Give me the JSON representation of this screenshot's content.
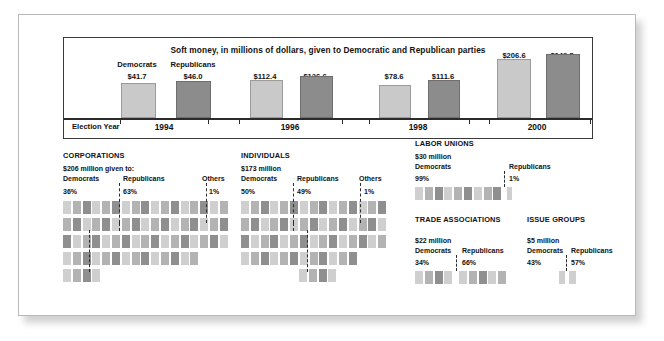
{
  "top": {
    "title": "Soft money, in millions of dollars, given to Democratic and Republican parties",
    "election_year_label": "Election Year",
    "legend": {
      "democrats": "Democrats",
      "republicans": "Republicans"
    },
    "years": [
      "1994",
      "1996",
      "1998",
      "2000"
    ],
    "values": {
      "1994": {
        "dem": "$41.7",
        "rep": "$46.0"
      },
      "1996": {
        "dem": "$112.4",
        "rep": "$126.6"
      },
      "1998": {
        "dem": "$78.6",
        "rep": "$111.6"
      },
      "2000": {
        "dem": "$206.6",
        "rep": "$242.5"
      }
    }
  },
  "sections": {
    "corporations": {
      "title": "CORPORATIONS",
      "amount": "$206 million given to:",
      "dem_label": "Democrats",
      "rep_label": "Republicans",
      "oth_label": "Others",
      "dem_pct": "36%",
      "rep_pct": "63%",
      "oth_pct": "1%"
    },
    "individuals": {
      "title": "INDIVIDUALS",
      "amount": "$173 million",
      "dem_label": "Democrats",
      "rep_label": "Republicans",
      "oth_label": "Others",
      "dem_pct": "50%",
      "rep_pct": "49%",
      "oth_pct": "1%"
    },
    "labor_unions": {
      "title": "LABOR UNIONS",
      "amount": "$30 million",
      "dem_label": "Democrats",
      "rep_label": "Republicans",
      "dem_pct": "99%",
      "rep_pct": "1%"
    },
    "trade_associations": {
      "title": "TRADE ASSOCIATIONS",
      "amount": "$22 million",
      "dem_label": "Democrats",
      "rep_label": "Republicans",
      "dem_pct": "34%",
      "rep_pct": "66%"
    },
    "issue_groups": {
      "title": "ISSUE GROUPS",
      "amount": "$5 million",
      "dem_label": "Democrats",
      "rep_label": "Republicans",
      "dem_pct": "43%",
      "rep_pct": "57%"
    }
  },
  "chart_data": [
    {
      "type": "bar",
      "title": "Soft money, in millions of dollars, given to Democratic and Republican parties",
      "xlabel": "Election Year",
      "ylabel": "",
      "categories": [
        "1994",
        "1996",
        "1998",
        "2000"
      ],
      "series": [
        {
          "name": "Democrats",
          "values": [
            41.7,
            112.4,
            78.6,
            206.6
          ],
          "color": "#c9c9c9"
        },
        {
          "name": "Republicans",
          "values": [
            46.0,
            126.6,
            111.6,
            242.5
          ],
          "color": "#8c8c8c"
        }
      ],
      "ylim": [
        0,
        260
      ],
      "grid": false,
      "legend_position": "inline-above-bars"
    },
    {
      "type": "pie",
      "title": "CORPORATIONS",
      "subtitle": "$206 million given to:",
      "labels": [
        "Democrats",
        "Republicans",
        "Others"
      ],
      "values": [
        36,
        63,
        1
      ],
      "unit": "%",
      "representation": "waffle-grid"
    },
    {
      "type": "pie",
      "title": "INDIVIDUALS",
      "subtitle": "$173 million",
      "labels": [
        "Democrats",
        "Republicans",
        "Others"
      ],
      "values": [
        50,
        49,
        1
      ],
      "unit": "%",
      "representation": "waffle-grid"
    },
    {
      "type": "pie",
      "title": "LABOR UNIONS",
      "subtitle": "$30 million",
      "labels": [
        "Democrats",
        "Republicans"
      ],
      "values": [
        99,
        1
      ],
      "unit": "%",
      "representation": "waffle-grid"
    },
    {
      "type": "pie",
      "title": "TRADE ASSOCIATIONS",
      "subtitle": "$22 million",
      "labels": [
        "Democrats",
        "Republicans"
      ],
      "values": [
        34,
        66
      ],
      "unit": "%",
      "representation": "waffle-grid"
    },
    {
      "type": "pie",
      "title": "ISSUE GROUPS",
      "subtitle": "$5 million",
      "labels": [
        "Democrats",
        "Republicans"
      ],
      "values": [
        43,
        57
      ],
      "unit": "%",
      "representation": "waffle-grid"
    }
  ]
}
